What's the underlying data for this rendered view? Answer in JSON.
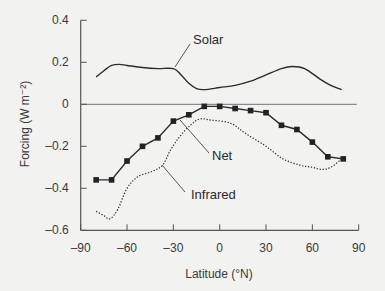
{
  "chart_data": {
    "type": "line",
    "title": "",
    "xlabel": "Latitude (°N)",
    "ylabel": "Forcing (W m⁻²)",
    "xlim": [
      -90,
      90
    ],
    "ylim": [
      -0.6,
      0.4
    ],
    "x_ticks": [
      -90,
      -60,
      -30,
      0,
      30,
      60,
      90
    ],
    "x_tick_labels": [
      "–90",
      "–60",
      "–30",
      "0",
      "30",
      "60",
      "90"
    ],
    "y_ticks": [
      0.4,
      0.2,
      0,
      -0.2,
      -0.4,
      -0.6
    ],
    "y_tick_labels": [
      "0.4",
      "0.2",
      "0",
      "–0.2",
      "–0.4",
      "–0.6"
    ],
    "grid": false,
    "zero_line": true,
    "legend": "inline labels with leader lines",
    "series": [
      {
        "name": "Solar",
        "style": "solid",
        "x": [
          -80,
          -75,
          -70,
          -65,
          -60,
          -50,
          -40,
          -30,
          -25,
          -20,
          -15,
          -10,
          0,
          10,
          20,
          30,
          40,
          47,
          55,
          65,
          72,
          79
        ],
        "values": [
          0.13,
          0.16,
          0.185,
          0.19,
          0.185,
          0.175,
          0.17,
          0.17,
          0.14,
          0.1,
          0.075,
          0.07,
          0.08,
          0.09,
          0.11,
          0.14,
          0.17,
          0.18,
          0.17,
          0.12,
          0.09,
          0.07
        ]
      },
      {
        "name": "Net",
        "style": "solid-square-markers",
        "x": [
          -80,
          -70,
          -60,
          -50,
          -40,
          -30,
          -20,
          -10,
          0,
          10,
          20,
          30,
          40,
          50,
          60,
          70,
          80
        ],
        "values": [
          -0.36,
          -0.36,
          -0.27,
          -0.2,
          -0.16,
          -0.08,
          -0.05,
          -0.01,
          -0.01,
          -0.02,
          -0.03,
          -0.04,
          -0.1,
          -0.12,
          -0.18,
          -0.25,
          -0.26
        ]
      },
      {
        "name": "Infrared",
        "style": "dotted",
        "x": [
          -80,
          -75,
          -71,
          -66,
          -60,
          -53,
          -44,
          -37,
          -32,
          -26,
          -19,
          -13,
          -6,
          7,
          17,
          30,
          41,
          52,
          60,
          66,
          72,
          79
        ],
        "values": [
          -0.51,
          -0.53,
          -0.545,
          -0.5,
          -0.4,
          -0.345,
          -0.32,
          -0.29,
          -0.22,
          -0.155,
          -0.1,
          -0.07,
          -0.075,
          -0.09,
          -0.14,
          -0.2,
          -0.26,
          -0.29,
          -0.3,
          -0.31,
          -0.3,
          -0.26
        ]
      }
    ],
    "annotations": [
      {
        "text": "Solar",
        "leader_from_lat": -30,
        "leader_from_val": 0.17
      },
      {
        "text": "Net",
        "leader_from_lat": -25,
        "leader_from_val": -0.07
      },
      {
        "text": "Infrared",
        "leader_from_lat": -38,
        "leader_from_val": -0.29
      }
    ]
  },
  "labels": {
    "solar": "Solar",
    "net": "Net",
    "infrared": "Infrared",
    "xlabel": "Latitude (°N)",
    "ylabel": "Forcing (W m⁻²)"
  },
  "colors": {
    "line": "#2b2b2b",
    "axis": "#555555",
    "zero_line": "#8a8a8a",
    "background": "#f2f2f1"
  }
}
